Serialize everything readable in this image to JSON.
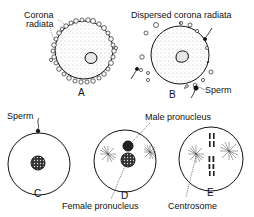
{
  "figure": {
    "panels": [
      {
        "id": "A",
        "label": "A",
        "annotations": [
          "Corona",
          "radiata"
        ]
      },
      {
        "id": "B",
        "label": "B",
        "annotations": [
          "Dispersed corona radiata",
          "Sperm"
        ]
      },
      {
        "id": "C",
        "label": "C",
        "annotations": [
          "Sperm"
        ]
      },
      {
        "id": "D",
        "label": "D",
        "annotations": [
          "Male pronucleus",
          "Female pronucleus"
        ]
      },
      {
        "id": "E",
        "label": "E",
        "annotations": [
          "Centrosome"
        ]
      }
    ]
  },
  "labels": {
    "corona": "Corona",
    "radiata": "radiata",
    "dispersed": "Dispersed corona radiata",
    "sperm_b": "Sperm",
    "sperm_c": "Sperm",
    "male_pronucleus": "Male pronucleus",
    "female_pronucleus": "Female pronucleus",
    "centrosome": "Centrosome",
    "A": "A",
    "B": "B",
    "C": "C",
    "D": "D",
    "E": "E"
  }
}
